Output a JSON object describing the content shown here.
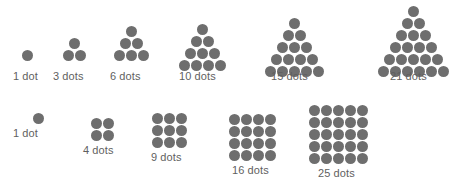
{
  "figure": {
    "background_color": "#ffffff",
    "dot_color": "#6e6e6e",
    "label_color": "#5f5f5f",
    "rows": [
      {
        "name": "triangular-numbers",
        "shape": "triangle",
        "groups": [
          {
            "label": "1 dot",
            "count": 1,
            "rows": 1
          },
          {
            "label": "3 dots",
            "count": 3,
            "rows": 2
          },
          {
            "label": "6 dots",
            "count": 6,
            "rows": 3
          },
          {
            "label": "10 dots",
            "count": 10,
            "rows": 4
          },
          {
            "label": "15 dots",
            "count": 15,
            "rows": 5
          },
          {
            "label": "21 dots",
            "count": 21,
            "rows": 6
          }
        ]
      },
      {
        "name": "square-numbers",
        "shape": "square",
        "groups": [
          {
            "label": "1 dot",
            "count": 1,
            "side": 1
          },
          {
            "label": "4 dots",
            "count": 4,
            "side": 2
          },
          {
            "label": "9 dots",
            "count": 9,
            "side": 3
          },
          {
            "label": "16 dots",
            "count": 16,
            "side": 4
          },
          {
            "label": "25 dots",
            "count": 25,
            "side": 5
          }
        ]
      }
    ]
  }
}
